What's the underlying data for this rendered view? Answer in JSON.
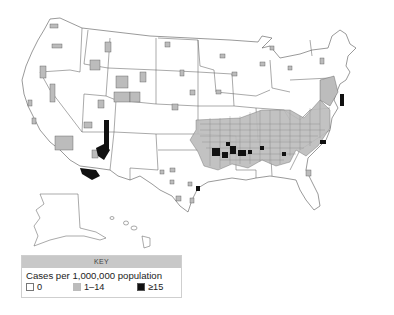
{
  "map": {
    "subject": "United States county map of case rates",
    "colors": {
      "zero": "#ffffff",
      "low": "#bcbcbc",
      "high": "#111111",
      "outline": "#555555"
    }
  },
  "legend": {
    "header": "KEY",
    "title": "Cases per 1,000,000 population",
    "items": [
      {
        "label": "0",
        "color": "#ffffff"
      },
      {
        "label": "1–14",
        "color": "#bcbcbc"
      },
      {
        "label": "≥15",
        "color": "#111111"
      }
    ]
  }
}
